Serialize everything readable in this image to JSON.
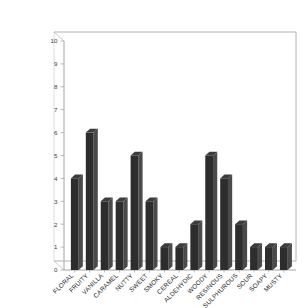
{
  "chart_data": {
    "type": "bar",
    "title": "",
    "subtitle": "",
    "xlabel": "",
    "ylabel": "",
    "categories": [
      "FLORAL",
      "FRUITY",
      "VANILLA",
      "CARAMEL",
      "NUTTY",
      "SWEET",
      "SMOKY",
      "CEREAL",
      "ALDEHYDIC",
      "WOODY",
      "RESINOUS",
      "SULPHUROUS",
      "SOUR",
      "SOAPY",
      "MUSTY"
    ],
    "values": [
      4,
      6,
      3,
      3,
      5,
      3,
      1,
      1,
      2,
      5,
      4,
      2,
      1,
      1,
      1
    ],
    "ylim": [
      0,
      10
    ],
    "ytick_labels": [
      "0",
      "1",
      "2",
      "3",
      "4",
      "5",
      "6",
      "7",
      "8",
      "9",
      "10"
    ],
    "ytick_values": [
      0,
      1,
      2,
      3,
      4,
      5,
      6,
      7,
      8,
      9,
      10
    ],
    "grid": false,
    "legend": false,
    "legend_position": "none",
    "bar_color": "#2d2d2d",
    "bar_side_color": "#4a4a4a",
    "bar_top_color": "#3c3c3c",
    "axis_color": "#b0b0b0",
    "background_color": "#ffffff",
    "xtick_rotation": -45,
    "style": "3d-column"
  }
}
